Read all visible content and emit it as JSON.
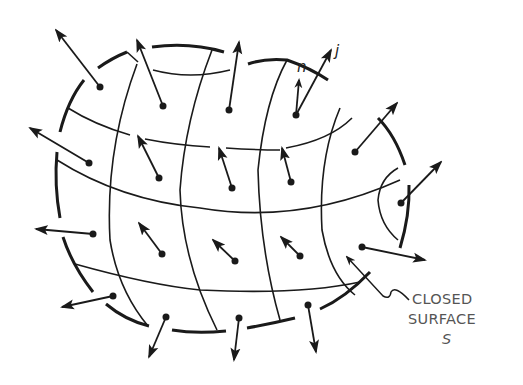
{
  "figure": {
    "labels": {
      "normal_vector": "n",
      "current_density": "j",
      "caption_line1": "CLOSED",
      "caption_line2": "SURFACE",
      "caption_line3": "S"
    },
    "colors": {
      "ink": "#1a1a1a",
      "caption": "#555555",
      "background": "#ffffff"
    }
  }
}
